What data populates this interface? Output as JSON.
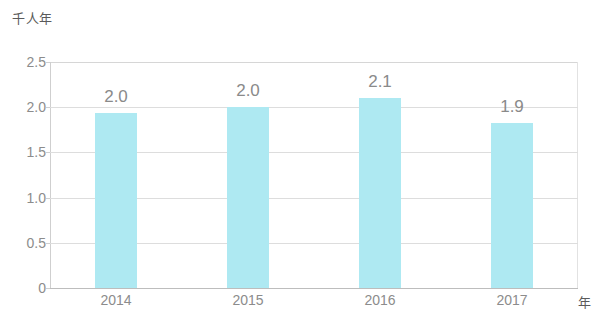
{
  "chart_data": {
    "type": "bar",
    "title": "",
    "subtitle": "",
    "xlabel": "年",
    "ylabel": "千人年",
    "categories": [
      "2014",
      "2015",
      "2016",
      "2017"
    ],
    "values": [
      2.0,
      2.0,
      2.1,
      1.9
    ],
    "data_labels": [
      "2.0",
      "2.0",
      "2.1",
      "1.9"
    ],
    "bar_plotted_heights": [
      1.94,
      2.0,
      2.1,
      1.82
    ],
    "ylim": [
      0,
      2.5
    ],
    "ytick_labels": [
      "0",
      "0.5",
      "1.0",
      "1.5",
      "2.0",
      "2.5"
    ],
    "ytick_values": [
      0,
      0.5,
      1.0,
      1.5,
      2.0,
      2.5
    ],
    "grid": true,
    "legend": false,
    "series": [
      {
        "name": "",
        "values": [
          2.0,
          2.0,
          2.1,
          1.9
        ]
      }
    ],
    "colors": {
      "bar": "#aee9f2",
      "grid": "#dddddd",
      "axis": "#bdbdbd",
      "tick_text": "#8c8c8c",
      "label_text": "#8a8a8a",
      "unit_text": "#5a5a5a",
      "background": "#ffffff"
    }
  }
}
